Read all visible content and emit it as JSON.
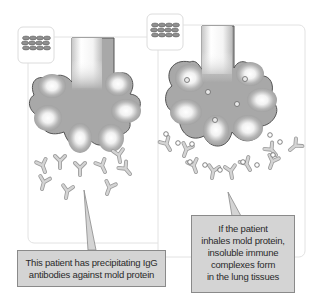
{
  "panels": [
    {
      "id": "left",
      "description": "Lung alveoli with free IgG antibodies",
      "icon": "mold-icon"
    },
    {
      "id": "right",
      "description": "Lung alveoli with immune complexes (antibody + mold protein)",
      "icon": "mold-icon"
    }
  ],
  "callouts": {
    "left": {
      "lines": [
        "This patient has precipitating IgG",
        "antibodies against mold protein"
      ]
    },
    "right": {
      "lines": [
        "If the patient",
        "inhales mold protein,",
        "insoluble immune",
        "complexes form",
        "in the lung tissues"
      ]
    }
  },
  "colors": {
    "panel_border": "#d9d9d9",
    "alveoli_fill": "#a9a9a9",
    "alveoli_highlight": "#ffffff",
    "antibody": "#b8b8b8",
    "callout_fill": "#d4d4d4",
    "callout_border": "#8a8a8a"
  }
}
